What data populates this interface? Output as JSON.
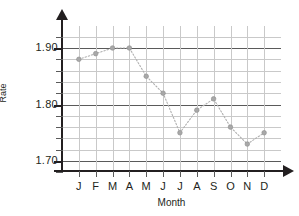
{
  "chart_data": {
    "type": "line",
    "title": "",
    "xlabel": "Month",
    "ylabel": "Rate",
    "categories": [
      "J",
      "F",
      "M",
      "A",
      "M",
      "J",
      "J",
      "A",
      "S",
      "O",
      "N",
      "D"
    ],
    "values": [
      1.88,
      1.89,
      1.9,
      1.9,
      1.85,
      1.82,
      1.75,
      1.79,
      1.81,
      1.76,
      1.73,
      1.75
    ],
    "ylim": [
      1.66,
      1.92
    ],
    "ytick_labels": [
      "1.90",
      "1.80",
      "1.70"
    ],
    "ytick_values": [
      1.9,
      1.8,
      1.7
    ],
    "yminor_step": 0.02,
    "grid": true,
    "legend": false,
    "marker": "circle",
    "line_style": "dotted",
    "series_color": "#a8a8a8",
    "gridline_color": "#c9c9c9",
    "major_gridline_color": "#5a5a5a",
    "axis_color": "#231f20"
  },
  "axes": {
    "y_title": "Rate",
    "x_title": "Month"
  }
}
